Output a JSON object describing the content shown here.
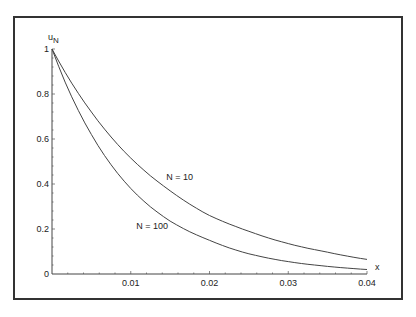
{
  "chart_data": {
    "type": "line",
    "title": "",
    "xlabel": "x",
    "ylabel": "u_N",
    "xlim": [
      0,
      0.04
    ],
    "ylim": [
      0,
      1
    ],
    "x_ticks": [
      "0.01",
      "0.02",
      "0.03",
      "0.04"
    ],
    "y_ticks": [
      "0",
      "0.2",
      "0.4",
      "0.6",
      "0.8",
      "1"
    ],
    "grid": false,
    "legend": null,
    "x": [
      0,
      0.005,
      0.01,
      0.015,
      0.02,
      0.025,
      0.03,
      0.035,
      0.04
    ],
    "series": [
      {
        "name": "N = 10",
        "values": [
          1.0,
          0.72,
          0.515,
          0.37,
          0.26,
          0.19,
          0.135,
          0.097,
          0.065
        ]
      },
      {
        "name": "N = 100",
        "values": [
          1.0,
          0.62,
          0.38,
          0.235,
          0.15,
          0.09,
          0.055,
          0.034,
          0.02
        ]
      }
    ],
    "annotations": [
      {
        "text": "N = 10",
        "x": 0.0145,
        "y": 0.42
      },
      {
        "text": "N = 100",
        "x": 0.0107,
        "y": 0.2
      }
    ]
  }
}
